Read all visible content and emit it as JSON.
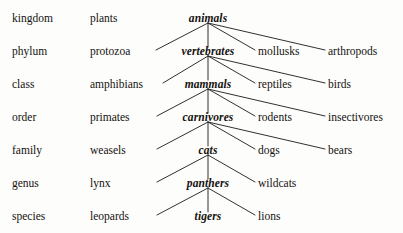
{
  "diagram": {
    "background_color": "#fdfdfb",
    "text_color": "#14120f",
    "line_color": "#1a1a1a",
    "rows": [
      {
        "rank": "kingdom",
        "left": "plants",
        "focus": "animals",
        "siblings": []
      },
      {
        "rank": "phylum",
        "left": "protozoa",
        "focus": "vertebrates",
        "siblings": [
          "mollusks",
          "arthropods"
        ]
      },
      {
        "rank": "class",
        "left": "amphibians",
        "focus": "mammals",
        "siblings": [
          "reptiles",
          "birds"
        ]
      },
      {
        "rank": "order",
        "left": "primates",
        "focus": "carnivores",
        "siblings": [
          "rodents",
          "insectivores"
        ]
      },
      {
        "rank": "family",
        "left": "weasels",
        "focus": "cats",
        "siblings": [
          "dogs",
          "bears"
        ]
      },
      {
        "rank": "genus",
        "left": "lynx",
        "focus": "panthers",
        "siblings": [
          "wildcats"
        ]
      },
      {
        "rank": "species",
        "left": "leopards",
        "focus": "tigers",
        "siblings": [
          "lions"
        ]
      }
    ]
  }
}
